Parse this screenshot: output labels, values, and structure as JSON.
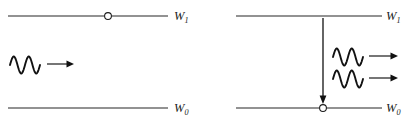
{
  "figure": {
    "type": "physics-energy-level-diagram",
    "topic": "stimulated-emission",
    "background_color": "#ffffff",
    "ink_color": "#1a1a1a",
    "width": 407,
    "height": 127
  },
  "panels": [
    {
      "id": "before",
      "name": "left-panel",
      "description": "Atom in excited state with one incident photon approaching",
      "levels": [
        {
          "id": "upper",
          "label_base": "W",
          "label_sub": "1",
          "label_full": "W1",
          "energy_state": "excited",
          "line_x1": 8,
          "line_x2": 168,
          "line_y": 16,
          "label_x": 174,
          "label_y": 20,
          "occupied": true,
          "marker_x": 108,
          "marker_y": 16,
          "marker_r": 3.4
        },
        {
          "id": "lower",
          "label_base": "W",
          "label_sub": "0",
          "label_full": "W0",
          "energy_state": "ground",
          "line_x1": 8,
          "line_x2": 168,
          "line_y": 108,
          "label_x": 174,
          "label_y": 112,
          "occupied": false
        }
      ],
      "photons": [
        {
          "id": "incident-photon",
          "name": "incident-photon",
          "wave_x": 10,
          "wave_y": 65,
          "wave_width": 30,
          "wave_amplitude": 8.5,
          "cycles": 2,
          "arrow_x1": 47,
          "arrow_x2": 74,
          "arrow_y": 64,
          "direction": "right"
        }
      ],
      "transitions": []
    },
    {
      "id": "after",
      "name": "right-panel",
      "description": "Atom decays to ground state emitting two coherent photons",
      "levels": [
        {
          "id": "upper",
          "label_base": "W",
          "label_sub": "1",
          "label_full": "W1",
          "energy_state": "excited",
          "line_x1": 236,
          "line_x2": 382,
          "line_y": 16,
          "label_x": 386,
          "label_y": 20,
          "occupied": false
        },
        {
          "id": "lower",
          "label_base": "W",
          "label_sub": "0",
          "label_full": "W0",
          "energy_state": "ground",
          "line_x1": 236,
          "line_x2": 382,
          "line_y": 108,
          "label_x": 386,
          "label_y": 112,
          "occupied": true,
          "marker_x": 323,
          "marker_y": 108,
          "marker_r": 3.4
        }
      ],
      "photons": [
        {
          "id": "emitted-photon-1",
          "name": "emitted-photon-1",
          "wave_x": 333,
          "wave_y": 57,
          "wave_width": 30,
          "wave_amplitude": 8.5,
          "cycles": 2,
          "arrow_x1": 369,
          "arrow_x2": 398,
          "arrow_y": 56,
          "direction": "right"
        },
        {
          "id": "emitted-photon-2",
          "name": "emitted-photon-2",
          "wave_x": 333,
          "wave_y": 79,
          "wave_width": 30,
          "wave_amplitude": 8.5,
          "cycles": 2,
          "arrow_x1": 369,
          "arrow_x2": 398,
          "arrow_y": 78,
          "direction": "right"
        }
      ],
      "transitions": [
        {
          "id": "downward-transition",
          "name": "downward-transition-arrow",
          "x": 323,
          "y1": 18,
          "y2": 104,
          "direction": "down",
          "from_level": "W1",
          "to_level": "W0"
        }
      ]
    }
  ]
}
